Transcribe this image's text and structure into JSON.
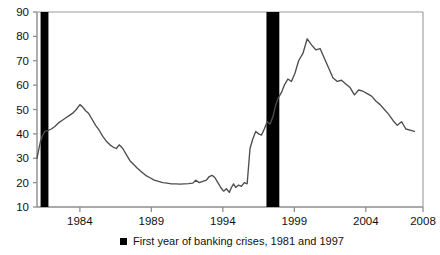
{
  "chart_data": {
    "type": "line",
    "title": "",
    "subtitle": "",
    "xlabel": "",
    "ylabel": "",
    "xlim": [
      1981,
      2008
    ],
    "ylim": [
      10,
      90
    ],
    "grid": false,
    "legend_position": "bottom-center",
    "y_ticks": [
      10,
      20,
      30,
      40,
      50,
      60,
      70,
      80,
      90
    ],
    "y_tick_labels": [
      "10",
      "20",
      "30",
      "40",
      "50",
      "60",
      "70",
      "80",
      "90"
    ],
    "x_ticks": [
      1984,
      1989,
      1994,
      1999,
      2004,
      2008
    ],
    "x_tick_labels": [
      "1984",
      "1989",
      "1994",
      "1999",
      "2004",
      "2008"
    ],
    "series": [
      {
        "name": "indicator-line",
        "color": "#4d4d4d",
        "x": [
          1981.0,
          1981.12,
          1981.25,
          1981.4,
          1981.55,
          1981.75,
          1982.0,
          1982.25,
          1982.5,
          1982.75,
          1983.0,
          1983.25,
          1983.5,
          1983.75,
          1984.0,
          1984.2,
          1984.4,
          1984.6,
          1984.85,
          1985.1,
          1985.35,
          1985.6,
          1985.85,
          1986.1,
          1986.35,
          1986.55,
          1986.75,
          1987.0,
          1987.25,
          1987.5,
          1987.75,
          1988.0,
          1988.3,
          1988.6,
          1988.9,
          1989.2,
          1989.5,
          1989.8,
          1990.1,
          1990.4,
          1990.7,
          1991.0,
          1991.3,
          1991.6,
          1991.9,
          1992.1,
          1992.35,
          1992.6,
          1992.85,
          1993.05,
          1993.25,
          1993.45,
          1993.65,
          1993.85,
          1994.05,
          1994.25,
          1994.45,
          1994.6,
          1994.75,
          1994.9,
          1995.1,
          1995.3,
          1995.5,
          1995.7,
          1995.9,
          1996.1,
          1996.3,
          1996.5,
          1996.7,
          1996.9,
          1997.1,
          1997.3,
          1997.5,
          1997.7,
          1997.9,
          1998.1,
          1998.3,
          1998.55,
          1998.8,
          1999.05,
          1999.3,
          1999.6,
          1999.9,
          2000.2,
          2000.5,
          2000.8,
          2001.1,
          2001.4,
          2001.7,
          2002.0,
          2002.3,
          2002.6,
          2002.9,
          2003.2,
          2003.5,
          2003.8,
          2004.1,
          2004.4,
          2004.7,
          2005.0,
          2005.3,
          2005.6,
          2005.9,
          2006.2,
          2006.5,
          2006.8,
          2007.1,
          2007.4
        ],
        "y": [
          30.0,
          33.5,
          37.0,
          39.5,
          41.0,
          41.3,
          42.0,
          43.0,
          44.5,
          45.5,
          46.5,
          47.5,
          48.5,
          50.0,
          52.0,
          51.0,
          49.5,
          48.5,
          46.0,
          43.5,
          41.5,
          39.0,
          37.0,
          35.5,
          34.5,
          34.0,
          35.5,
          34.0,
          31.5,
          29.0,
          27.5,
          26.0,
          24.5,
          23.0,
          22.0,
          21.0,
          20.5,
          20.0,
          19.8,
          19.5,
          19.5,
          19.4,
          19.5,
          19.6,
          19.8,
          21.0,
          20.0,
          20.5,
          21.0,
          22.5,
          23.0,
          22.0,
          20.0,
          18.0,
          16.5,
          17.5,
          16.0,
          18.0,
          19.5,
          18.0,
          19.0,
          18.5,
          20.0,
          19.5,
          34.0,
          38.0,
          41.0,
          40.0,
          39.5,
          42.0,
          45.0,
          44.0,
          47.0,
          52.0,
          55.0,
          57.0,
          60.0,
          62.5,
          61.5,
          65.0,
          70.0,
          73.0,
          79.0,
          76.5,
          74.5,
          75.0,
          71.0,
          67.0,
          63.0,
          61.5,
          62.0,
          60.5,
          59.0,
          56.0,
          58.0,
          57.5,
          56.5,
          55.5,
          53.5,
          52.0,
          50.0,
          48.0,
          45.5,
          43.5,
          45.0,
          42.0,
          41.5,
          41.0
        ]
      }
    ],
    "crisis_bands": [
      {
        "label": "1981 banking crisis",
        "year": 1981.25,
        "width_years": 0.55
      },
      {
        "label": "1997 banking crisis",
        "year": 1997.05,
        "width_years": 0.9
      }
    ],
    "legend": [
      {
        "label": "First year of banking crises, 1981 and 1997",
        "marker": "filled-square",
        "color": "#000000"
      }
    ]
  }
}
